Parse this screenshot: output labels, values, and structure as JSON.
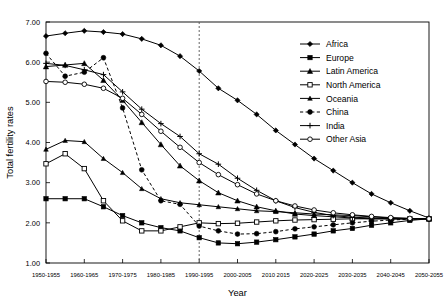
{
  "chart_data": {
    "type": "line",
    "title": "",
    "xlabel": "Year",
    "ylabel": "Total fertility rates",
    "ylim": [
      1.0,
      7.0
    ],
    "ytick_labels": [
      "1.00",
      "2.00",
      "3.00",
      "4.00",
      "5.00",
      "6.00",
      "7.00"
    ],
    "ytick_values": [
      1.0,
      2.0,
      3.0,
      4.0,
      5.0,
      6.0,
      7.0
    ],
    "grid": false,
    "legend_position": "right-top",
    "categories": [
      "1950-1955",
      "1955-1960",
      "1960-1965",
      "1965-1970",
      "1970-1975",
      "1975-1980",
      "1980-1985",
      "1985-1990",
      "1990-1995",
      "1995-2000",
      "2000-2005",
      "2005-2010",
      "2010-2015",
      "2015-2020",
      "2020-2025",
      "2025-2030",
      "2030-2035",
      "2035-2040",
      "2040-2045",
      "2045-2050",
      "2050-2055"
    ],
    "xtick_labels": [
      "1950-1955",
      "1960-1965",
      "1970-1975",
      "1980-1985",
      "1990-1995",
      "2000-2005",
      "2010 2015",
      "2020-2025",
      "2030-2035",
      "2040-2045",
      "2050-2055"
    ],
    "xtick_indices": [
      0,
      2,
      4,
      6,
      8,
      10,
      12,
      14,
      16,
      18,
      20
    ],
    "annotations": [
      {
        "name": "projection-divider",
        "type": "vline",
        "at_category": "1990-1995",
        "style": "dotted"
      }
    ],
    "series": [
      {
        "name": "Africa",
        "marker": "filled-diamond",
        "dash": false,
        "values": [
          6.65,
          6.72,
          6.78,
          6.75,
          6.7,
          6.58,
          6.42,
          6.15,
          5.78,
          5.35,
          5.05,
          4.7,
          4.3,
          3.95,
          3.6,
          3.3,
          3.0,
          2.72,
          2.5,
          2.3,
          2.12
        ]
      },
      {
        "name": "Europe",
        "marker": "filled-square",
        "dash": false,
        "values": [
          2.6,
          2.6,
          2.6,
          2.4,
          2.18,
          2.0,
          1.88,
          1.8,
          1.63,
          1.5,
          1.48,
          1.52,
          1.58,
          1.65,
          1.72,
          1.8,
          1.86,
          1.94,
          2.0,
          2.06,
          2.1
        ]
      },
      {
        "name": "Latin America",
        "marker": "filled-triangle",
        "dash": false,
        "values": [
          5.89,
          5.93,
          5.97,
          5.55,
          5.05,
          4.5,
          3.95,
          3.42,
          3.05,
          2.75,
          2.55,
          2.4,
          2.3,
          2.22,
          2.18,
          2.15,
          2.12,
          2.1,
          2.1,
          2.1,
          2.1
        ]
      },
      {
        "name": "North America",
        "marker": "open-square",
        "dash": false,
        "values": [
          3.47,
          3.72,
          3.35,
          2.55,
          2.05,
          1.8,
          1.8,
          1.9,
          2.0,
          1.98,
          1.99,
          2.02,
          2.05,
          2.07,
          2.08,
          2.09,
          2.1,
          2.1,
          2.1,
          2.1,
          2.1
        ]
      },
      {
        "name": "Oceania",
        "marker": "filled-triangle-small",
        "dash": false,
        "values": [
          3.83,
          4.05,
          4.02,
          3.6,
          3.25,
          2.85,
          2.6,
          2.5,
          2.45,
          2.4,
          2.35,
          2.3,
          2.28,
          2.25,
          2.22,
          2.2,
          2.18,
          2.15,
          2.12,
          2.11,
          2.1
        ]
      },
      {
        "name": "China",
        "marker": "filled-circle",
        "dash": true,
        "values": [
          6.22,
          5.65,
          5.75,
          6.11,
          4.86,
          3.32,
          2.55,
          2.46,
          1.92,
          1.8,
          1.72,
          1.73,
          1.78,
          1.85,
          1.9,
          1.95,
          2.0,
          2.04,
          2.07,
          2.09,
          2.1
        ]
      },
      {
        "name": "India",
        "marker": "plus",
        "dash": false,
        "values": [
          5.97,
          5.92,
          5.81,
          5.69,
          5.26,
          4.83,
          4.47,
          4.15,
          3.72,
          3.46,
          3.11,
          2.81,
          2.55,
          2.38,
          2.26,
          2.18,
          2.14,
          2.12,
          2.1,
          2.1,
          2.1
        ]
      },
      {
        "name": "Other Asia",
        "marker": "open-circle",
        "dash": false,
        "values": [
          5.52,
          5.5,
          5.45,
          5.35,
          5.1,
          4.7,
          4.28,
          3.88,
          3.5,
          3.2,
          2.95,
          2.72,
          2.55,
          2.42,
          2.32,
          2.25,
          2.2,
          2.16,
          2.13,
          2.11,
          2.1
        ]
      }
    ]
  },
  "legend": {
    "items": [
      {
        "label": "Africa"
      },
      {
        "label": "Europe"
      },
      {
        "label": "Latin America"
      },
      {
        "label": "North America"
      },
      {
        "label": "Oceania"
      },
      {
        "label": "China"
      },
      {
        "label": "India"
      },
      {
        "label": "Other Asia"
      }
    ]
  }
}
